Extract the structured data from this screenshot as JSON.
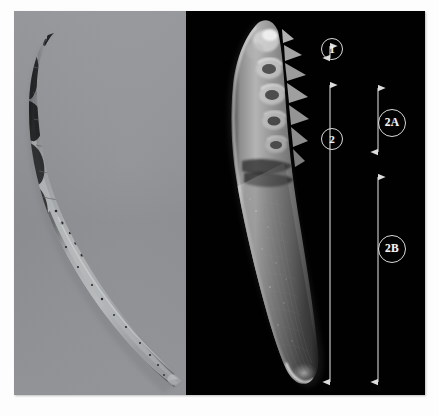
{
  "figure": {
    "type": "two-panel-micrograph",
    "background_color": "#fdfdfd",
    "panels": [
      {
        "id": "left",
        "name": "light-micrograph-panel",
        "modality": "light microscopy",
        "background_color": "#8e9094",
        "specimen_description": "curved tapering segmented specimen, dark pigmented anterior, pale tapering posterior tail"
      },
      {
        "id": "right",
        "name": "sem-panel",
        "modality": "scanning electron micrograph",
        "background_color": "#010101",
        "specimen_description": "curved tapering specimen with serrated spine-like projections along the anterior margin"
      }
    ]
  },
  "annotations": {
    "measure_bars": [
      {
        "id": "bar-1",
        "label": "1",
        "label_shape": "circle",
        "x": 316,
        "y_top": 27,
        "y_bottom": 55,
        "label_x": 331,
        "label_y": 38,
        "description": "anterior tip region measurement"
      },
      {
        "id": "bar-2",
        "label": "2",
        "label_shape": "circle",
        "x": 316,
        "y_top": 66,
        "y_bottom": 379,
        "label_x": 331,
        "label_y": 128,
        "description": "total body length below tip"
      },
      {
        "id": "bar-2a",
        "label": "2A",
        "label_shape": "circle",
        "x": 364,
        "y_top": 69,
        "y_bottom": 149,
        "label_x": 378,
        "label_y": 112,
        "description": "upper serrated subsection"
      },
      {
        "id": "bar-2b",
        "label": "2B",
        "label_shape": "circle",
        "x": 364,
        "y_top": 158,
        "y_bottom": 379,
        "label_x": 378,
        "label_y": 238,
        "description": "lower smooth tapering subsection"
      }
    ],
    "line_color": "#d6d6d6",
    "label_text_color": "#f2f2f2"
  }
}
